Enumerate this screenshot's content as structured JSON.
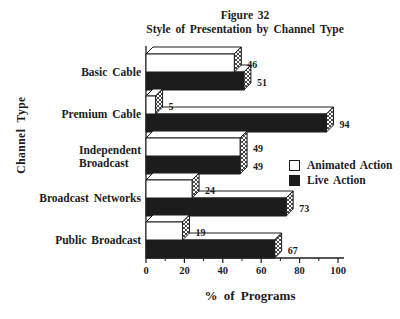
{
  "figure": {
    "title_lines": [
      "Figure 32",
      "Style of Presentation by Channel Type"
    ],
    "xlabel": "% of Programs",
    "ylabel": "Channel Type"
  },
  "legend": {
    "items": [
      {
        "label": "Animated Action",
        "color": "#ffffff"
      },
      {
        "label": "Live Action",
        "color": "#1c1c1c"
      }
    ]
  },
  "chart_data": {
    "type": "bar",
    "orientation": "horizontal",
    "style": "3d-extruded-bars-with-hatched-end-caps",
    "title": "Figure 32",
    "subtitle": "Style of Presentation by Channel Type",
    "xlabel": "% of Programs",
    "ylabel": "Channel Type",
    "xlim": [
      0,
      100
    ],
    "x_major_ticks": [
      0,
      20,
      40,
      60,
      80,
      100
    ],
    "x_minor_ticks": [
      10,
      30,
      50,
      70,
      90
    ],
    "grid": false,
    "legend_position": "inside-right",
    "categories": [
      "Basic Cable",
      "Premium Cable",
      "Independent Broadcast",
      "Broadcast Networks",
      "Public Broadcast"
    ],
    "category_display_lines": [
      [
        "Basic Cable"
      ],
      [
        "Premium Cable"
      ],
      [
        "Independent",
        "Broadcast"
      ],
      [
        "Broadcast Networks"
      ],
      [
        "Public Broadcast"
      ]
    ],
    "series": [
      {
        "name": "Animated Action",
        "color": "#ffffff",
        "values": [
          46,
          5,
          49,
          24,
          19
        ]
      },
      {
        "name": "Live Action",
        "color": "#1c1c1c",
        "values": [
          51,
          94,
          49,
          73,
          67
        ]
      }
    ]
  },
  "colors": {
    "ink": "#1c1c1c",
    "paper": "#ffffff"
  }
}
